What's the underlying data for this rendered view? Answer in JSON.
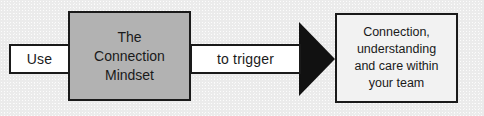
{
  "diagram": {
    "title": "Use The Connection Mindset to trigger Connection, understanding and care within your team",
    "background_color": "#ebebeb",
    "nodes": {
      "use_label": {
        "text": "Use",
        "fill": "#ffffff",
        "border": "#1a1a1a"
      },
      "center_box": {
        "text": "The\nConnection\nMindset",
        "fill": "#b2b2b2",
        "border": "#1a1a1a"
      },
      "trigger_label": {
        "text": "to trigger",
        "fill": "#ffffff",
        "border": "#1a1a1a"
      },
      "outcome_box": {
        "text": "Connection,\nunderstanding\nand care within\nyour team",
        "fill": "#f2f2f2",
        "border": "#1a1a1a"
      }
    },
    "arrow": {
      "direction": "left-to-right",
      "color": "#111111",
      "shaft_fill": "#ffffff"
    }
  }
}
